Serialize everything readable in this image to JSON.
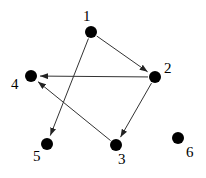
{
  "graph": {
    "directed": true,
    "nodes": [
      {
        "id": "1",
        "label": "1",
        "x": 91,
        "y": 32,
        "label_x": 83,
        "label_y": 9
      },
      {
        "id": "2",
        "label": "2",
        "x": 155,
        "y": 77,
        "label_x": 164,
        "label_y": 61
      },
      {
        "id": "3",
        "label": "3",
        "x": 116,
        "y": 145,
        "label_x": 118,
        "label_y": 152
      },
      {
        "id": "4",
        "label": "4",
        "x": 31,
        "y": 76,
        "label_x": 11,
        "label_y": 77
      },
      {
        "id": "5",
        "label": "5",
        "x": 47,
        "y": 144,
        "label_x": 33,
        "label_y": 149
      },
      {
        "id": "6",
        "label": "6",
        "x": 178,
        "y": 138,
        "label_x": 186,
        "label_y": 145
      }
    ],
    "edges": [
      {
        "from": "1",
        "to": "2"
      },
      {
        "from": "1",
        "to": "5"
      },
      {
        "from": "2",
        "to": "4"
      },
      {
        "from": "2",
        "to": "3"
      },
      {
        "from": "3",
        "to": "4"
      }
    ],
    "colors": {
      "node": "#000000",
      "edge": "#333333",
      "background": "#ffffff"
    }
  }
}
